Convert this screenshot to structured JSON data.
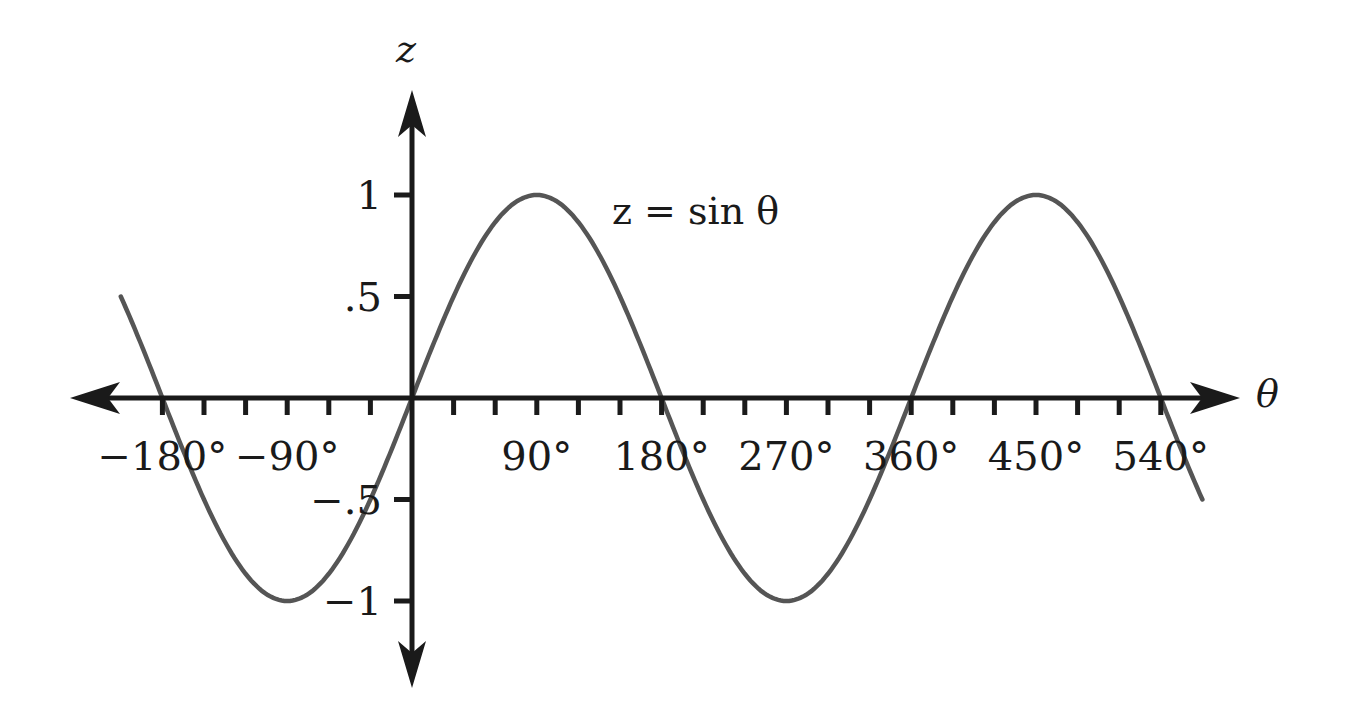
{
  "chart_data": {
    "type": "line",
    "title": "",
    "xlabel": "θ",
    "ylabel": "z",
    "annotation": "z = sin θ",
    "function": "sin",
    "x_unit": "degrees",
    "xlim": [
      -200,
      570
    ],
    "ylim": [
      -1.3,
      1.3
    ],
    "grid": false,
    "legend": "none",
    "x_ticks": [
      -180,
      -150,
      -120,
      -90,
      -60,
      -30,
      0,
      30,
      60,
      90,
      120,
      150,
      180,
      210,
      240,
      270,
      300,
      330,
      360,
      390,
      420,
      450,
      480,
      510,
      540
    ],
    "x_tick_labels": [
      {
        "value": -180,
        "label": "−180°"
      },
      {
        "value": -90,
        "label": "−90°"
      },
      {
        "value": 90,
        "label": "90°"
      },
      {
        "value": 180,
        "label": "180°"
      },
      {
        "value": 270,
        "label": "270°"
      },
      {
        "value": 360,
        "label": "360°"
      },
      {
        "value": 450,
        "label": "450°"
      },
      {
        "value": 540,
        "label": "540°"
      }
    ],
    "y_tick_labels": [
      {
        "value": 1,
        "label": "1"
      },
      {
        "value": 0.5,
        "label": ".5"
      },
      {
        "value": -0.5,
        "label": "−.5"
      },
      {
        "value": -1,
        "label": "−1"
      }
    ],
    "series": [
      {
        "name": "z = sin θ",
        "x": [
          -200,
          -180,
          -90,
          0,
          90,
          180,
          270,
          360,
          450,
          540,
          570
        ],
        "values": [
          0.34,
          0,
          -1,
          0,
          1,
          0,
          -1,
          0,
          1,
          0,
          -0.5
        ]
      }
    ],
    "colors": {
      "curve": "#555555",
      "axes": "#1a1a1a"
    }
  }
}
